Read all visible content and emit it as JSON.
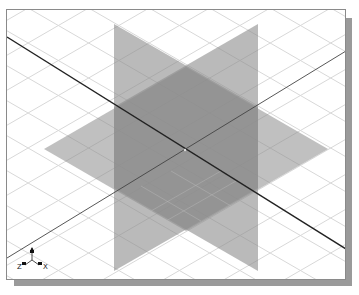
{
  "viewport": {
    "view": "isometric",
    "grid": {
      "visible": true,
      "color": "#d8d8d8"
    },
    "colors": {
      "background": "#ffffff",
      "frame": "#8a8a8a",
      "shadow": "#9a9a9a",
      "plane_fill": "#8c8c8c",
      "plane_opacity": "0.6",
      "axis_line_dark": "#222222",
      "axis_line_light": "#444444"
    },
    "triad": {
      "labels": {
        "x": "X",
        "y": "Y",
        "z": "Z"
      }
    }
  }
}
